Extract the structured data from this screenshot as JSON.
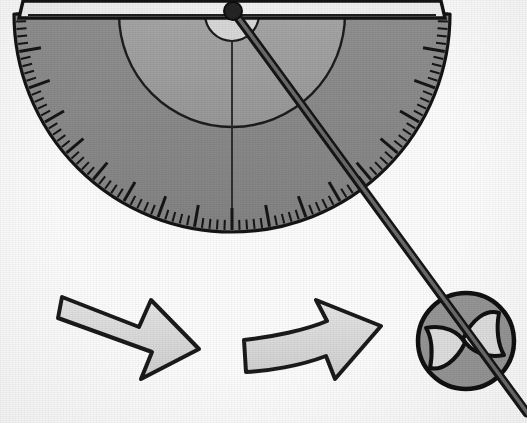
{
  "figure": {
    "background_color": "#fdfdfd",
    "width": 527,
    "height": 423
  },
  "palette": {
    "ink": "#1a1a1a",
    "outer_ring_gray": "#8a8a8a",
    "mid_ring_gray": "#9e9e9e",
    "inner_disc_light": "#d8d8d8",
    "top_strip_white": "#f2f2f2",
    "rod_gray": "#5a5a5a",
    "rod_dark": "#3a3a3a",
    "arrow_fill": "#dcdcdc",
    "spinner_body": "#969696",
    "spinner_blade": "#e0e0e0"
  },
  "protractor": {
    "name": "protractor",
    "center_x": 232,
    "center_y": 14,
    "outer_radius": 218,
    "mid_radius": 113,
    "inner_radius": 27,
    "baseline_y": 14,
    "top_bar_height": 14,
    "left_x": 24,
    "right_x": 440,
    "bottom_y": 232,
    "tick_count": 90,
    "major_tick_every": 5,
    "minor_tick_length": 10,
    "major_tick_length": 22,
    "scale_span_degrees": 180
  },
  "rod": {
    "name": "measuring-rod",
    "pivot_x": 233,
    "pivot_y": 11,
    "end_x": 527,
    "end_y": 413,
    "thickness": 9,
    "pivot_knob_radius": 9,
    "angle_from_vertical_degrees": 36
  },
  "spinner": {
    "name": "spinner-disc",
    "center_x": 466,
    "center_y": 341,
    "radius": 48,
    "blade_count": 2
  },
  "arrows": [
    {
      "name": "motion-arrow-left",
      "label": "first motion arrow",
      "tip_x": 181,
      "tip_y": 352,
      "tail_x": 64,
      "tail_y": 299,
      "direction": "down-right"
    },
    {
      "name": "motion-arrow-right",
      "label": "second motion arrow",
      "tip_x": 382,
      "tip_y": 341,
      "tail_x": 243,
      "tail_y": 352,
      "direction": "right-up"
    }
  ]
}
